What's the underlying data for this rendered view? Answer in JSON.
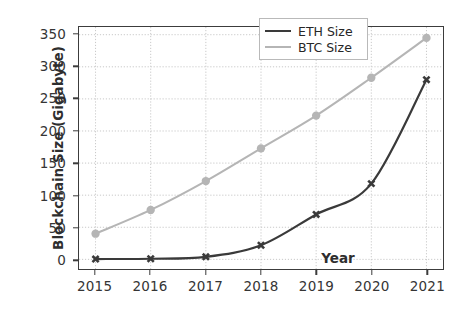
{
  "chart_data": {
    "type": "line",
    "title": "",
    "xlabel": "Year",
    "ylabel": "Blockchain Size (Gigabyte)",
    "categories": [
      "2015",
      "2016",
      "2017",
      "2018",
      "2019",
      "2020",
      "2021"
    ],
    "x": [
      2015,
      2016,
      2017,
      2018,
      2019,
      2020,
      2021
    ],
    "xlim": [
      2014.7,
      2021.3
    ],
    "ylim": [
      -15,
      362
    ],
    "yticks": [
      0,
      50,
      100,
      150,
      200,
      250,
      300,
      350
    ],
    "ytick_labels": [
      "0",
      "50",
      "100",
      "150",
      "200",
      "250",
      "300",
      "350"
    ],
    "xticks": [
      2015,
      2016,
      2017,
      2018,
      2019,
      2020,
      2021
    ],
    "xtick_labels": [
      "2015",
      "2016",
      "2017",
      "2018",
      "2019",
      "2020",
      "2021"
    ],
    "grid": true,
    "grid_style": "dotted",
    "legend_position": "upper center",
    "series": [
      {
        "name": "ETH Size",
        "color": "#3a3a3a",
        "marker": "X",
        "linewidth": 2.2,
        "values": [
          0.5,
          1,
          4,
          22,
          70,
          118,
          280
        ]
      },
      {
        "name": "BTC Size",
        "color": "#b5b5b5",
        "marker": "o",
        "linewidth": 2.0,
        "values": [
          40,
          77,
          122,
          173,
          224,
          283,
          345
        ]
      }
    ]
  },
  "legend": {
    "items": [
      {
        "label": "ETH Size",
        "color": "#3a3a3a"
      },
      {
        "label": "BTC Size",
        "color": "#b5b5b5"
      }
    ]
  },
  "axes": {
    "y_title": "Blockchain Size (Gigabyte)",
    "x_title": "Year"
  },
  "colors": {
    "eth": "#3a3a3a",
    "btc": "#b5b5b5",
    "axis": "#3c3c3c",
    "grid": "#c9c9c9",
    "background": "#ffffff",
    "text": "#353535"
  }
}
